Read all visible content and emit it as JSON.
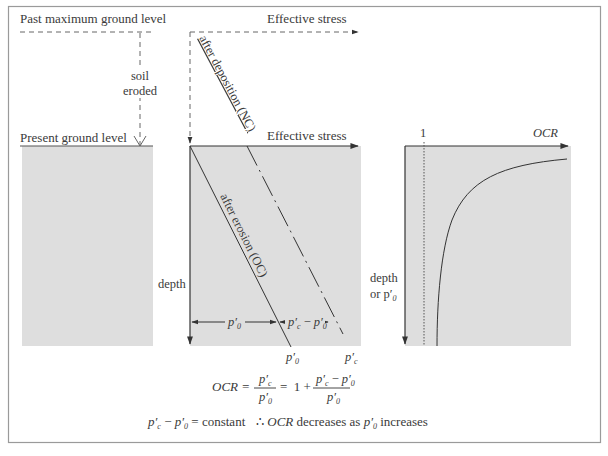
{
  "colors": {
    "frame": "#9a9a9a",
    "panel_fill": "#dedede",
    "line": "#333333",
    "text": "#3a3a3a"
  },
  "left_panel": {
    "past_level_label": "Past maximum ground level",
    "soil_label_1": "soil",
    "soil_label_2": "eroded",
    "present_level_label": "Present ground level"
  },
  "middle_panel": {
    "top_axis_label": "Effective stress",
    "axis_label": "Effective stress",
    "depth_label": "depth",
    "nc_line_label": "after deposition (NC)",
    "oc_line_label": "after erosion (OC)",
    "dim_p0": "p′",
    "dim_p0_sub": "0",
    "dim_diff_a": "p′",
    "dim_diff_a_sub": "c",
    "dim_diff_minus": " − ",
    "dim_diff_b": "p′",
    "dim_diff_b_sub": "0",
    "tick_p0": "p′",
    "tick_p0_sub": "0",
    "tick_pc": "p′",
    "tick_pc_sub": "c"
  },
  "right_panel": {
    "one_label": "1",
    "axis_label": "OCR",
    "depth_label_1": "depth",
    "depth_label_2": "or p′",
    "depth_label_2_sub": "0"
  },
  "equations": {
    "ocr_lhs": "OCR =",
    "frac1_num": "p′",
    "frac1_num_sub": "c",
    "frac1_den": "p′",
    "frac1_den_sub": "0",
    "equals_one_plus": "=  1 +",
    "frac2_num_a": "p′",
    "frac2_num_a_sub": "c",
    "frac2_num_minus": " − ",
    "frac2_num_b": "p′",
    "frac2_num_b_sub": "0",
    "frac2_den": "p′",
    "frac2_den_sub": "0",
    "constant_a": "p′",
    "constant_a_sub": "c",
    "constant_minus": " − ",
    "constant_b": "p′",
    "constant_b_sub": "0",
    "constant_rest": " = constant",
    "therefore": "∴ ",
    "therefore_ocr": "OCR",
    "therefore_mid": " decreases as ",
    "therefore_p": "p′",
    "therefore_p_sub": "0",
    "therefore_end": " increases"
  }
}
